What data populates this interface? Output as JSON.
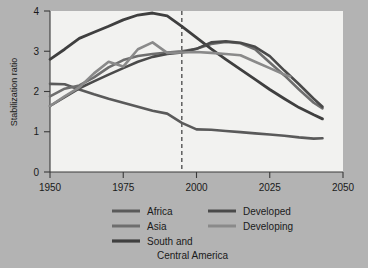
{
  "chart_data": {
    "type": "line",
    "title": "",
    "xlabel": "",
    "ylabel": "Stabilization ratio",
    "xlim": [
      1950,
      2050
    ],
    "ylim": [
      0,
      4
    ],
    "xticks": [
      1950,
      1975,
      2000,
      2025,
      2050
    ],
    "yticks": [
      0,
      1,
      2,
      3,
      4
    ],
    "grid": false,
    "legend_position": "below",
    "annotations": [
      {
        "name": "present-year-marker",
        "type": "vertical-dashed-line",
        "x": 1995,
        "label": ""
      }
    ],
    "series": [
      {
        "name": "Africa",
        "color": "#5a5a5a",
        "x": [
          1950,
          1955,
          1960,
          1965,
          1970,
          1975,
          1980,
          1985,
          1990,
          1995,
          2000,
          2005,
          2010,
          2015,
          2020,
          2025,
          2030,
          2035,
          2040,
          2043
        ],
        "values": [
          2.19,
          2.18,
          2.05,
          1.93,
          1.82,
          1.72,
          1.62,
          1.52,
          1.45,
          1.22,
          1.06,
          1.05,
          1.02,
          0.99,
          0.96,
          0.93,
          0.9,
          0.86,
          0.83,
          0.84
        ]
      },
      {
        "name": "Asia",
        "color": "#6e6e6e",
        "x": [
          1950,
          1955,
          1960,
          1965,
          1970,
          1975,
          1980,
          1985,
          1990,
          1995,
          2000,
          2005,
          2010,
          2015,
          2020,
          2025,
          2030,
          2035,
          2040,
          2043
        ],
        "values": [
          1.88,
          2.07,
          2.15,
          2.35,
          2.6,
          2.78,
          2.88,
          2.93,
          2.97,
          3.0,
          3.06,
          3.18,
          3.23,
          3.2,
          3.05,
          2.72,
          2.4,
          2.05,
          1.72,
          1.58
        ]
      },
      {
        "name": "South and Central America",
        "color": "#3f3f3f",
        "x": [
          1950,
          1955,
          1960,
          1965,
          1970,
          1975,
          1980,
          1985,
          1990,
          1995,
          2000,
          2005,
          2010,
          2015,
          2020,
          2025,
          2030,
          2035,
          2040,
          2043
        ],
        "values": [
          2.8,
          3.05,
          3.32,
          3.47,
          3.62,
          3.78,
          3.9,
          3.95,
          3.88,
          3.62,
          3.34,
          3.06,
          2.8,
          2.55,
          2.3,
          2.05,
          1.82,
          1.6,
          1.42,
          1.32
        ]
      },
      {
        "name": "Developed",
        "color": "#4a4a4a",
        "x": [
          1950,
          1955,
          1960,
          1965,
          1970,
          1975,
          1980,
          1985,
          1990,
          1995,
          2000,
          2005,
          2010,
          2015,
          2020,
          2025,
          2030,
          2035,
          2040,
          2043
        ],
        "values": [
          1.64,
          1.86,
          2.08,
          2.25,
          2.42,
          2.58,
          2.74,
          2.86,
          2.93,
          2.97,
          3.06,
          3.22,
          3.25,
          3.21,
          3.11,
          2.88,
          2.52,
          2.18,
          1.82,
          1.62
        ]
      },
      {
        "name": "Developing",
        "color": "#8a8a8a",
        "x": [
          1950,
          1955,
          1960,
          1965,
          1970,
          1975,
          1980,
          1985,
          1990,
          1995,
          2000,
          2005,
          2010,
          2015,
          2020,
          2025,
          2030,
          2032
        ],
        "values": [
          1.64,
          1.88,
          2.1,
          2.45,
          2.74,
          2.62,
          3.05,
          3.22,
          2.96,
          2.97,
          2.98,
          2.96,
          2.93,
          2.9,
          2.74,
          2.58,
          2.42,
          2.37
        ]
      }
    ]
  },
  "axes": {
    "y_title": "Stabilization ratio",
    "x_tick_labels": [
      "1950",
      "1975",
      "2000",
      "2025",
      "2050"
    ],
    "y_tick_labels": [
      "0",
      "1",
      "2",
      "3",
      "4"
    ]
  },
  "legend": {
    "entries": [
      {
        "label": "Africa",
        "color": "#5a5a5a"
      },
      {
        "label": "Asia",
        "color": "#6e6e6e"
      },
      {
        "label": "South and",
        "color": "#3f3f3f"
      },
      {
        "label": "Central America",
        "color": "#3f3f3f"
      },
      {
        "label": "Developed",
        "color": "#4a4a4a"
      },
      {
        "label": "Developing",
        "color": "#8a8a8a"
      }
    ]
  },
  "colors": {
    "page_background": "#b3b3b3",
    "plot_background": "#f2f2f0",
    "axis": "#3a3a3a",
    "text": "#1a1a1a"
  }
}
